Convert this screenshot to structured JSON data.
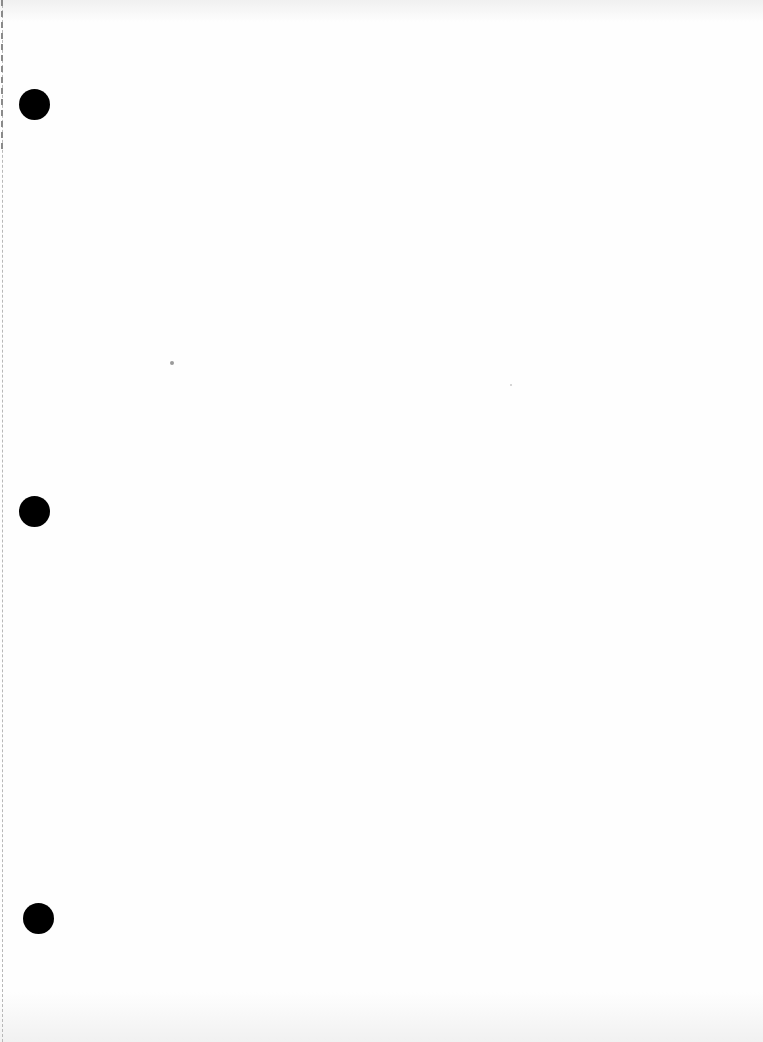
{
  "document": {
    "type": "blank scanned page",
    "text": "",
    "punch_holes": [
      {
        "x": 19,
        "y": 89
      },
      {
        "x": 19,
        "y": 496
      },
      {
        "x": 23,
        "y": 903
      }
    ],
    "colors": {
      "paper": "#fefefe",
      "punch_hole": "#000000",
      "margin_line": "#b8b8b8"
    }
  }
}
